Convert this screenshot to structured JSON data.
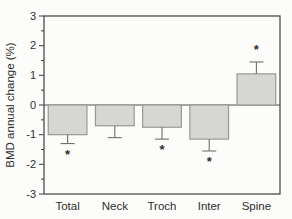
{
  "chart_data": {
    "type": "bar",
    "title": "",
    "xlabel": "",
    "ylabel": "BMD annual change (%)",
    "categories": [
      "Total",
      "Neck",
      "Troch",
      "Inter",
      "Spine"
    ],
    "values": [
      -1.0,
      -0.7,
      -0.75,
      -1.15,
      1.05
    ],
    "errors": [
      0.3,
      0.4,
      0.4,
      0.4,
      0.4
    ],
    "significant": [
      true,
      false,
      true,
      true,
      true
    ],
    "significance_marker": "*",
    "ylim": [
      -3,
      3
    ],
    "yticks": [
      -3,
      -2,
      -1,
      0,
      1,
      2,
      3
    ],
    "ytick_labels": [
      "-3",
      "-2",
      "-1",
      "0",
      "1",
      "2",
      "3"
    ],
    "yminor_interval": 0.5,
    "grid": false,
    "legend": "none",
    "frame": "full-box",
    "colors": {
      "bar_fill": "#d6d6d3",
      "bar_border": "#989894",
      "axis": "#4d4d4a",
      "error_bar": "#6e6e6a",
      "text": "#2e2e2c",
      "background": "#fcfcfa"
    }
  }
}
